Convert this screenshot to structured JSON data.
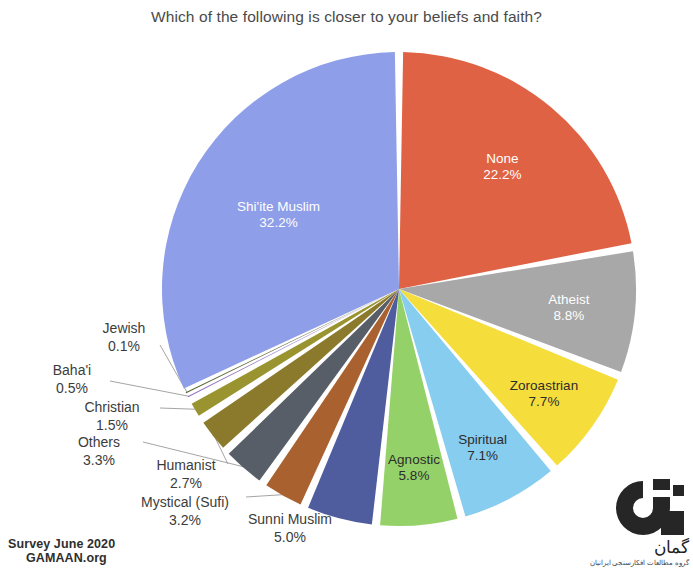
{
  "chart_data": {
    "type": "pie",
    "title": "Which of the following is closer to your beliefs and faith?",
    "xlabel": "",
    "ylabel": "",
    "legend": "none",
    "grid": false,
    "value_unit": "%",
    "start_angle_deg": 0,
    "direction": "clockwise",
    "categories": [
      "None",
      "Atheist",
      "Zoroastrian",
      "Spiritual",
      "Agnostic",
      "Sunni Muslim",
      "Mystical (Sufi)",
      "Others",
      "Humanist",
      "Christian",
      "Baha'i",
      "Jewish",
      "Shi'ite Muslim"
    ],
    "values": [
      22.2,
      8.8,
      7.7,
      7.1,
      5.8,
      5.0,
      3.2,
      3.3,
      2.7,
      1.5,
      0.5,
      0.1,
      32.2
    ],
    "colors": [
      "#df6244",
      "#a8a8a8",
      "#f5dd3c",
      "#87cdf0",
      "#94d169",
      "#4f5d9e",
      "#a9622f",
      "#585e67",
      "#8c7a2c",
      "#9a9430",
      "#9272c4",
      "#55632c",
      "#8e9ee8"
    ],
    "label_placement": [
      "inside",
      "inside",
      "inside",
      "inside",
      "inside",
      "outside",
      "outside",
      "outside",
      "outside",
      "outside",
      "outside",
      "outside",
      "inside"
    ],
    "slices": [
      {
        "name": "None",
        "value": 22.2,
        "label": "None",
        "percent_text": "22.2%",
        "color": "#df6244",
        "text_color": "#ffffff",
        "placement": "inside"
      },
      {
        "name": "Atheist",
        "value": 8.8,
        "label": "Atheist",
        "percent_text": "8.8%",
        "color": "#a8a8a8",
        "text_color": "#ffffff",
        "placement": "inside"
      },
      {
        "name": "Zoroastrian",
        "value": 7.7,
        "label": "Zoroastrian",
        "percent_text": "7.7%",
        "color": "#f5dd3c",
        "text_color": "#2c2c2c",
        "placement": "inside"
      },
      {
        "name": "Spiritual",
        "value": 7.1,
        "label": "Spiritual",
        "percent_text": "7.1%",
        "color": "#87cdf0",
        "text_color": "#2c2c2c",
        "placement": "inside"
      },
      {
        "name": "Agnostic",
        "value": 5.8,
        "label": "Agnostic",
        "percent_text": "5.8%",
        "color": "#94d169",
        "text_color": "#2c2c2c",
        "placement": "inside"
      },
      {
        "name": "Sunni Muslim",
        "value": 5.0,
        "label": "Sunni Muslim",
        "percent_text": "5.0%",
        "color": "#4f5d9e",
        "text_color": "#3c3c3c",
        "placement": "outside"
      },
      {
        "name": "Mystical (Sufi)",
        "value": 3.2,
        "label": "Mystical (Sufi)",
        "percent_text": "3.2%",
        "color": "#a9622f",
        "text_color": "#3c3c3c",
        "placement": "outside"
      },
      {
        "name": "Others",
        "value": 3.3,
        "label": "Others",
        "percent_text": "3.3%",
        "color": "#585e67",
        "text_color": "#3c3c3c",
        "placement": "outside"
      },
      {
        "name": "Humanist",
        "value": 2.7,
        "label": "Humanist",
        "percent_text": "2.7%",
        "color": "#8c7a2c",
        "text_color": "#3c3c3c",
        "placement": "outside"
      },
      {
        "name": "Christian",
        "value": 1.5,
        "label": "Christian",
        "percent_text": "1.5%",
        "color": "#9a9430",
        "text_color": "#3c3c3c",
        "placement": "outside"
      },
      {
        "name": "Baha'i",
        "value": 0.5,
        "label": "Baha'i",
        "percent_text": "0.5%",
        "color": "#9272c4",
        "text_color": "#3c3c3c",
        "placement": "outside"
      },
      {
        "name": "Jewish",
        "value": 0.1,
        "label": "Jewish",
        "percent_text": "0.1%",
        "color": "#55632c",
        "text_color": "#3c3c3c",
        "placement": "outside"
      },
      {
        "name": "Shi'ite Muslim",
        "value": 32.2,
        "label": "Shi'ite Muslim",
        "percent_text": "32.2%",
        "color": "#8e9ee8",
        "text_color": "#ffffff",
        "placement": "inside"
      }
    ]
  },
  "title": "Which of the following is closer to your beliefs and faith?",
  "credit": {
    "line1": "Survey June 2020",
    "line2": "GAMAAN.org"
  },
  "logo": {
    "mark": "gamaan-g-logo",
    "script_main": "گمان",
    "script_sub": "گروه مطالعات افکارسنجی ایرانیان"
  }
}
